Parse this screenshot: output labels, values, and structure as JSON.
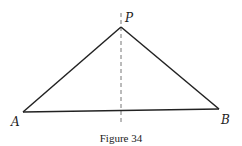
{
  "figure": {
    "caption": "Figure 34",
    "points": {
      "P": {
        "label": "P",
        "x": 121,
        "y": 27
      },
      "A": {
        "label": "A",
        "x": 23,
        "y": 112
      },
      "B": {
        "label": "B",
        "x": 219,
        "y": 109
      }
    },
    "dashed_line": {
      "x": 121,
      "y1": 13,
      "y2": 124
    },
    "colors": {
      "stroke": "#222222",
      "dash": "#777777",
      "background": "#ffffff"
    }
  }
}
